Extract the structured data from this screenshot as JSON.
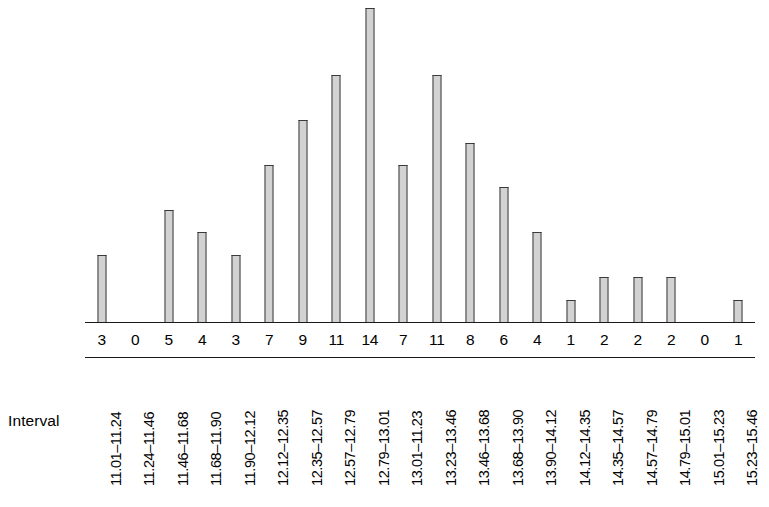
{
  "chart_data": {
    "type": "bar",
    "title": "",
    "subtitle": "",
    "xlabel": "Interval",
    "ylabel": "",
    "ylim": [
      0,
      14
    ],
    "grid": false,
    "legend": null,
    "axis_title_row_label": "Interval",
    "categories": [
      "11.01–11.24",
      "11.24–11.46",
      "11.46–11.68",
      "11.68–11.90",
      "11.90–12.12",
      "12.12–12.35",
      "12.35–12.57",
      "12.57–12.79",
      "12.79–13.01",
      "13.01–11.23",
      "13.23–13.46",
      "13.46–13.68",
      "13.68–13.90",
      "13.90–14.12",
      "14.12–14.35",
      "14.35–14.57",
      "14.57–14.79",
      "14.79–15.01",
      "15.01–15.23",
      "15.23–15.46"
    ],
    "values": [
      3,
      0,
      5,
      4,
      3,
      7,
      9,
      11,
      14,
      7,
      11,
      8,
      6,
      4,
      1,
      2,
      2,
      2,
      0,
      1
    ],
    "value_labels": [
      "3",
      "0",
      "5",
      "4",
      "3",
      "7",
      "9",
      "11",
      "14",
      "7",
      "11",
      "8",
      "6",
      "4",
      "1",
      "2",
      "2",
      "2",
      "0",
      "1"
    ],
    "bar_fill_color": "#d2d2d2",
    "bar_border_color": "#3a3a3a",
    "axis_line_color": "#1a1a1a",
    "background_color": "#ffffff"
  }
}
